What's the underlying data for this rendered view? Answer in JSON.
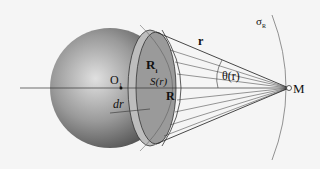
{
  "diagram": {
    "labels": {
      "origin": "O",
      "origin_sub": "1",
      "r_i": "R",
      "r_i_sub": "i",
      "s_r": "S(r)",
      "R": "R",
      "dr": "dr",
      "r": "r",
      "theta": "θ(r)",
      "M": "M",
      "sigma": "σ",
      "sigma_sub": "R"
    },
    "colors": {
      "background": "#f5f5f5",
      "sphere_light": "#d8d8d8",
      "sphere_dark": "#5a5a5a",
      "cap": "#9a9a9a",
      "lines": "#333333"
    }
  }
}
